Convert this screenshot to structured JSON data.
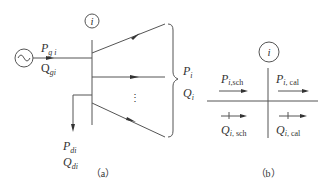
{
  "panel_a": {
    "caption": "（a）",
    "bus_label": "i",
    "generator": {
      "symbol": "~",
      "P_main": "P",
      "P_sub": "g i",
      "Q_main": "Q",
      "Q_sub": "gi"
    },
    "load": {
      "P_main": "P",
      "P_sub": "di",
      "Q_main": "Q",
      "Q_sub": "di"
    },
    "branches": {
      "P_main": "P",
      "P_sub": "i",
      "Q_main": "Q",
      "Q_sub": "i",
      "ellipsis": "⋮"
    }
  },
  "panel_b": {
    "caption": "（b）",
    "bus_label": "i",
    "top_left": {
      "main": "P",
      "sub_i": "i",
      "sub": ",sch"
    },
    "top_right": {
      "main": "P",
      "sub_i": "i",
      "sub": ", cal"
    },
    "bottom_left": {
      "main": "Q",
      "sub_i": "i",
      "sub": ", sch"
    },
    "bottom_right": {
      "main": "Q",
      "sub_i": "i",
      "sub": ", cal"
    }
  },
  "colors": {
    "line": "#444444",
    "text": "#333333",
    "background": "#ffffff"
  }
}
